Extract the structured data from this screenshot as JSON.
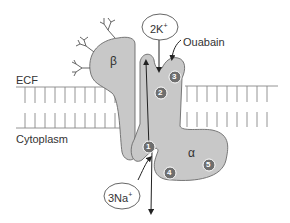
{
  "diagram": {
    "regions": {
      "top": "ECF",
      "bottom": "Cytoplasm"
    },
    "subunits": {
      "beta": "β",
      "alpha": "α"
    },
    "ions": {
      "potassium": {
        "label": "2K",
        "charge": "+"
      },
      "sodium": {
        "label": "3Na",
        "charge": "+"
      }
    },
    "inhibitor": "Ouabain",
    "sites": [
      "1",
      "2",
      "3",
      "4",
      "5"
    ],
    "colors": {
      "protein_fill": "#c8c8c8",
      "protein_stroke": "#6a6a6a",
      "site_fill": "#6e6e6e",
      "site_text": "#ffffff",
      "membrane": "#777777",
      "text": "#333333"
    }
  }
}
